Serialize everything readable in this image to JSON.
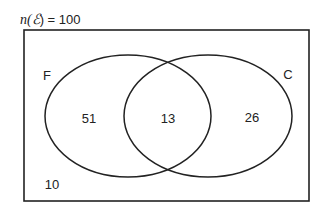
{
  "diagram": {
    "type": "venn",
    "universe": {
      "label_prefix": "n(",
      "symbol": "ℰ",
      "label_suffix": ") = ",
      "total": "100"
    },
    "sets": [
      {
        "name": "F",
        "only_count": "51"
      },
      {
        "name": "C",
        "only_count": "26"
      }
    ],
    "intersection_count": "13",
    "outside_count": "10"
  },
  "colors": {
    "stroke": "#222222",
    "background": "#ffffff",
    "text": "#222222"
  }
}
